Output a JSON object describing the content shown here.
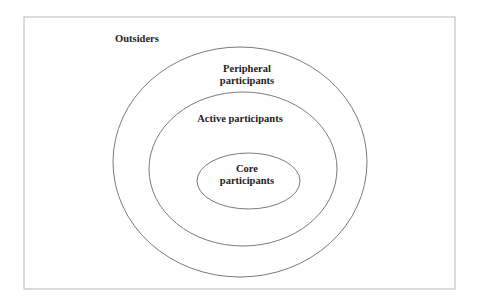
{
  "diagram": {
    "type": "concentric-ellipses",
    "frame": {
      "x": 24,
      "y": 17,
      "width": 431,
      "height": 272
    },
    "colors": {
      "frame_stroke": "#c4c4c4",
      "ring_stroke": "#7a7a7a",
      "text": "#222222",
      "background": "#ffffff"
    },
    "layers": [
      {
        "id": "outsiders",
        "label_lines": [
          "Outsiders"
        ],
        "region": "outside outer ellipse"
      },
      {
        "id": "peripheral",
        "label_lines": [
          "Peripheral",
          "participants"
        ],
        "ellipse": {
          "cx": 240,
          "cy": 162,
          "rx": 127,
          "ry": 115
        }
      },
      {
        "id": "active",
        "label_lines": [
          "Active participants"
        ],
        "ellipse": {
          "cx": 243,
          "cy": 169,
          "rx": 94,
          "ry": 77
        }
      },
      {
        "id": "core",
        "label_lines": [
          "Core",
          "participants"
        ],
        "ellipse": {
          "cx": 248.5,
          "cy": 181,
          "rx": 51.5,
          "ry": 28
        }
      }
    ]
  }
}
